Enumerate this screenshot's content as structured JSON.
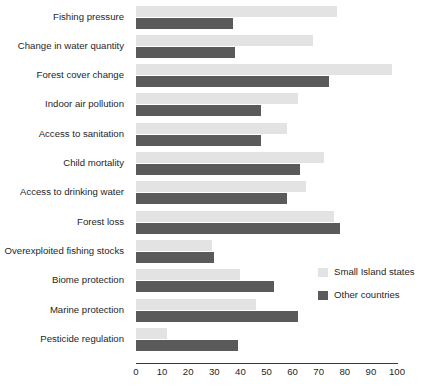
{
  "chart_data": {
    "type": "bar",
    "orientation": "horizontal",
    "title": "",
    "xlabel": "",
    "ylabel": "",
    "xlim": [
      0,
      100
    ],
    "xticks": [
      0,
      10,
      20,
      30,
      40,
      50,
      60,
      70,
      80,
      90,
      100
    ],
    "grid": false,
    "legend_position": "right-middle",
    "categories": [
      "Fishing pressure",
      "Change in water quantity",
      "Forest cover change",
      "Indoor air pollution",
      "Access to sanitation",
      "Child mortality",
      "Access to drinking water",
      "Forest loss",
      "Overexploited fishing stocks",
      "Biome protection",
      "Marine protection",
      "Pesticide regulation"
    ],
    "series": [
      {
        "name": "Small Island states",
        "color": "#e3e3e3",
        "values": [
          77,
          68,
          98,
          62,
          58,
          72,
          65,
          76,
          29,
          40,
          46,
          12
        ]
      },
      {
        "name": "Other countries",
        "color": "#5a5a5a",
        "values": [
          37,
          38,
          74,
          48,
          48,
          63,
          58,
          78,
          30,
          53,
          62,
          39
        ]
      }
    ]
  },
  "legend": {
    "items": [
      {
        "label": "Small Island states",
        "swatch": "light"
      },
      {
        "label": "Other countries",
        "swatch": "dark"
      }
    ]
  }
}
